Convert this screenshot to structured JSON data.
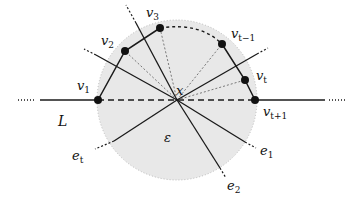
{
  "diagram": {
    "center_label": "x",
    "region_label": "ε",
    "line_label": "L",
    "vertices": [
      {
        "label": "v",
        "sub": "1"
      },
      {
        "label": "v",
        "sub": "2"
      },
      {
        "label": "v",
        "sub": "3"
      },
      {
        "label": "v",
        "sub": "t−1"
      },
      {
        "label": "v",
        "sub": "t"
      },
      {
        "label": "v",
        "sub": "t+1"
      }
    ],
    "edges": [
      {
        "label": "e",
        "sub": "t"
      },
      {
        "label": "e",
        "sub": "1"
      },
      {
        "label": "e",
        "sub": "2"
      }
    ],
    "colors": {
      "disk_fill": "#e8e8e8",
      "stroke": "#1a1a1a",
      "dotted": "#555555"
    }
  }
}
